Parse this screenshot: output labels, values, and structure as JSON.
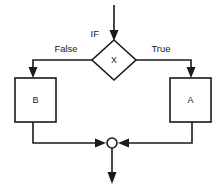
{
  "diagram": {
    "background_color": "#ffffff",
    "line_color": "#1a1a1a",
    "fill_color": "#ffffff",
    "type": "flowchart",
    "nodes": {
      "entry_label": "IF",
      "decision": {
        "label": "X",
        "shape": "diamond"
      },
      "false_branch_box": {
        "label": "B",
        "shape": "rectangle"
      },
      "true_branch_box": {
        "label": "A",
        "shape": "rectangle"
      },
      "merge": {
        "label": "",
        "shape": "circle"
      }
    },
    "edges": {
      "false_label": "False",
      "true_label": "True"
    }
  }
}
